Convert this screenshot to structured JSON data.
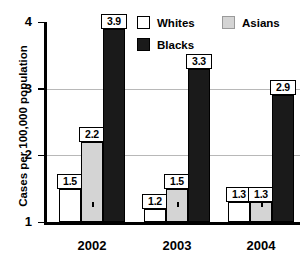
{
  "chart_data": {
    "type": "bar",
    "title": "",
    "xlabel": "",
    "ylabel": "Cases per 100,000 population",
    "categories": [
      "2002",
      "2003",
      "2004"
    ],
    "series": [
      {
        "name": "Whites",
        "color": "#ffffff",
        "values": [
          1.5,
          1.2,
          1.3
        ],
        "labels": [
          "1.5",
          "1.2",
          "1.3"
        ]
      },
      {
        "name": "Asians",
        "color": "#d4d4d4",
        "values": [
          2.2,
          1.5,
          1.3
        ],
        "labels": [
          "2.2",
          "1.5",
          "1.3"
        ]
      },
      {
        "name": "Blacks",
        "color": "#1a1a1a",
        "values": [
          3.9,
          3.3,
          2.9
        ],
        "labels": [
          "3.9",
          "3.3",
          "2.9"
        ]
      }
    ],
    "ylim": [
      1,
      4
    ],
    "yticks": [
      1,
      2,
      3,
      4
    ],
    "ytick_labels": [
      "1",
      "2",
      "3",
      "4"
    ],
    "grid": true,
    "legend_position": "top-right"
  },
  "axis": {
    "y_title": "Cases per 100,000 population",
    "y_ticks": [
      {
        "label": "4",
        "value": 4
      },
      {
        "label": "3",
        "value": 3
      },
      {
        "label": "2",
        "value": 2
      },
      {
        "label": "1",
        "value": 1
      }
    ],
    "x_groups": [
      {
        "label": "2002"
      },
      {
        "label": "2003"
      },
      {
        "label": "2004"
      }
    ]
  },
  "legend": {
    "entries": [
      {
        "label": "Whites",
        "swatch": "whites"
      },
      {
        "label": "Asians",
        "swatch": "asians"
      },
      {
        "label": "Blacks",
        "swatch": "blacks"
      }
    ]
  },
  "bars": [
    {
      "group": "2002",
      "series": "Whites",
      "value": 1.5,
      "label": "1.5"
    },
    {
      "group": "2002",
      "series": "Asians",
      "value": 2.2,
      "label": "2.2"
    },
    {
      "group": "2002",
      "series": "Blacks",
      "value": 3.9,
      "label": "3.9"
    },
    {
      "group": "2003",
      "series": "Whites",
      "value": 1.2,
      "label": "1.2"
    },
    {
      "group": "2003",
      "series": "Asians",
      "value": 1.5,
      "label": "1.5"
    },
    {
      "group": "2003",
      "series": "Blacks",
      "value": 3.3,
      "label": "3.3"
    },
    {
      "group": "2004",
      "series": "Whites",
      "value": 1.3,
      "label": "1.3"
    },
    {
      "group": "2004",
      "series": "Asians",
      "value": 1.3,
      "label": "1.3"
    },
    {
      "group": "2004",
      "series": "Blacks",
      "value": 2.9,
      "label": "2.9"
    }
  ]
}
